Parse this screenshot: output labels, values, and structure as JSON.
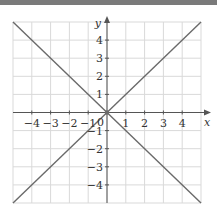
{
  "chart_data": {
    "type": "line",
    "title": "",
    "xlabel": "x",
    "ylabel": "y",
    "xlim": [
      -5,
      5
    ],
    "ylim": [
      -5,
      5
    ],
    "grid": true,
    "x_ticks": [
      -4,
      -3,
      -2,
      -1,
      0,
      1,
      2,
      3,
      4
    ],
    "y_ticks": [
      -4,
      -3,
      -2,
      -1,
      1,
      2,
      3,
      4
    ],
    "x_tick_labels": [
      "−4",
      "−3",
      "−2",
      "−1",
      "0",
      "1",
      "2",
      "3",
      "4"
    ],
    "y_tick_labels": [
      "−4",
      "−3",
      "−2",
      "−1",
      "1",
      "2",
      "3",
      "4"
    ],
    "origin_label": "0",
    "series": [
      {
        "name": "y = x",
        "x": [
          -5,
          5
        ],
        "y": [
          -5,
          5
        ]
      },
      {
        "name": "y = -x",
        "x": [
          -5,
          5
        ],
        "y": [
          5,
          -5
        ]
      }
    ],
    "colors": {
      "line": "#6a6a6a",
      "grid": "#d9d9d9",
      "axis": "#555555",
      "topbar": "#7a7a7a"
    }
  }
}
